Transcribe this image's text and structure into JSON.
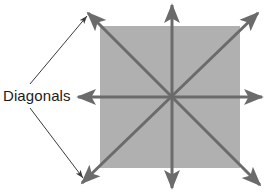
{
  "figure": {
    "title": "",
    "background_color": "#ffffff",
    "square": {
      "name": "square-shape",
      "fill_color": "#b0b0b0",
      "x": 100,
      "y": 26,
      "width": 140,
      "height": 142
    },
    "center_point": {
      "x": 170,
      "y": 97
    },
    "arrow_color": "#6b6b6b",
    "arrow_stroke_width": 3,
    "arrows": [
      {
        "id": "horizontal",
        "label": "horizontal-double-arrow",
        "x1": 78,
        "y1": 97,
        "x2": 262,
        "y2": 97
      },
      {
        "id": "vertical",
        "label": "vertical-double-arrow",
        "x1": 172,
        "y1": 5,
        "x2": 172,
        "y2": 188
      },
      {
        "id": "diagonal-nwse",
        "label": "diagonal-nwse-double-arrow",
        "x1": 88,
        "y1": 13,
        "x2": 260,
        "y2": 185
      },
      {
        "id": "diagonal-swne",
        "label": "diagonal-swne-double-arrow",
        "x1": 82,
        "y1": 183,
        "x2": 258,
        "y2": 13
      }
    ],
    "callout": {
      "text": "Diagonals",
      "text_x": 3,
      "text_y": 101,
      "leader_color": "#3a3a3a",
      "leader_stroke_width": 1,
      "leaders": [
        {
          "id": "leader-upper",
          "x1": 30,
          "y1": 84,
          "x2": 87,
          "y2": 16
        },
        {
          "id": "leader-lower",
          "x1": 30,
          "y1": 108,
          "x2": 83,
          "y2": 178
        }
      ]
    }
  }
}
